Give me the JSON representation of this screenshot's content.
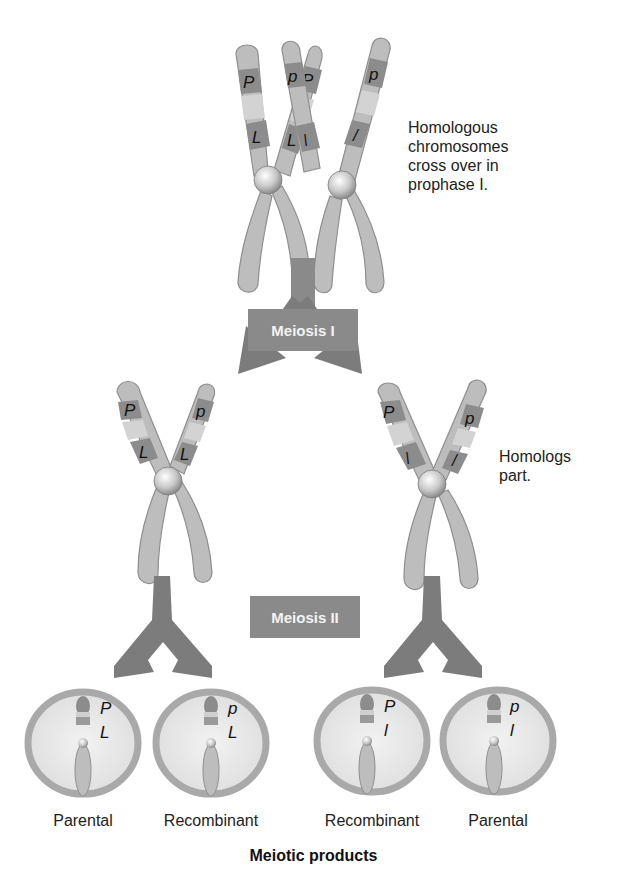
{
  "diagram": {
    "colors": {
      "chromosome": "#bdbdbd",
      "band_dark": "#8c8c8c",
      "band_light": "#d3d3d3",
      "arrow": "#7c7c7c",
      "label_box": "#8a8a8a",
      "cell_ring": "#a9a9a9",
      "cell_fill": "#e6e6e6"
    },
    "annotations": {
      "prophase": "Homologous\nchromosomes\ncross over in\nprophase I.",
      "prophase_lines": [
        "Homologous",
        "chromosomes",
        "cross over in",
        "prophase I."
      ],
      "homologs_part_lines": [
        "Homologs",
        "part."
      ]
    },
    "stages": {
      "meiosis_1": "Meiosis I",
      "meiosis_2": "Meiosis II"
    },
    "top_pair": {
      "left_chromatids": [
        {
          "upper": "P",
          "lower": "L"
        },
        {
          "upper": "P",
          "lower": "L"
        }
      ],
      "right_chromatids": [
        {
          "upper": "p",
          "lower": "l"
        },
        {
          "upper": "p",
          "lower": "l"
        }
      ]
    },
    "after_meiosis_1": {
      "left": {
        "chromatid_a": {
          "upper": "P",
          "lower": "L"
        },
        "chromatid_b": {
          "upper": "p",
          "lower": "L"
        }
      },
      "right": {
        "chromatid_a": {
          "upper": "P",
          "lower": "l"
        },
        "chromatid_b": {
          "upper": "p",
          "lower": "l"
        }
      }
    },
    "products": [
      {
        "upper": "P",
        "lower": "L",
        "label": "Parental"
      },
      {
        "upper": "p",
        "lower": "L",
        "label": "Recombinant"
      },
      {
        "upper": "P",
        "lower": "l",
        "label": "Recombinant"
      },
      {
        "upper": "p",
        "lower": "l",
        "label": "Parental"
      }
    ],
    "footer": "Meiotic products"
  }
}
